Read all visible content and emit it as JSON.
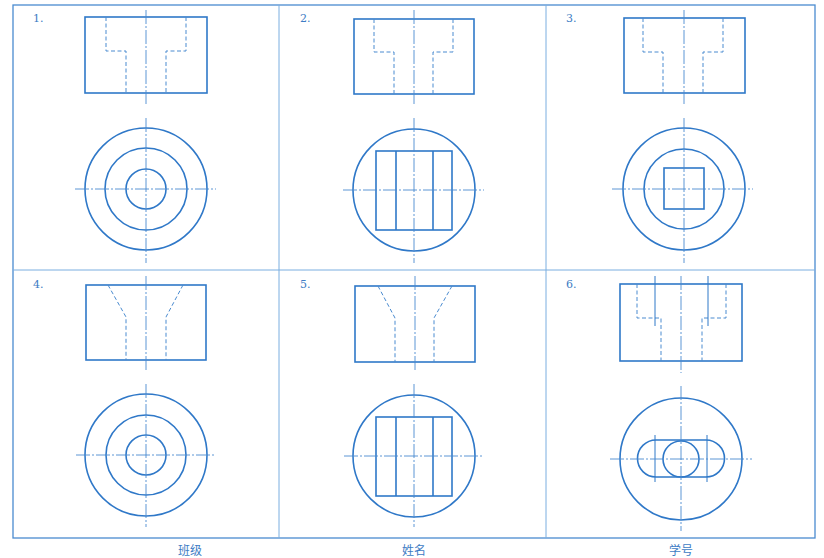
{
  "colors": {
    "line": "#2f78c8",
    "frame": "#4a8bd0",
    "text": "#3d7cc4",
    "background": "#ffffff"
  },
  "problems": [
    {
      "number": "1.",
      "front_view": "rectangle-with-stepped-hidden-bore",
      "top_view": "three-concentric-circles"
    },
    {
      "number": "2.",
      "front_view": "rectangle-with-stepped-hidden-bore",
      "top_view": "circle-with-square-and-two-vertical-lines"
    },
    {
      "number": "3.",
      "front_view": "rectangle-with-stepped-hidden-bore",
      "top_view": "two-concentric-circles-with-inner-square"
    },
    {
      "number": "4.",
      "front_view": "rectangle-with-hidden-funnel-bore",
      "top_view": "three-concentric-circles"
    },
    {
      "number": "5.",
      "front_view": "rectangle-with-hidden-funnel-bore",
      "top_view": "circle-with-square-and-two-vertical-lines"
    },
    {
      "number": "6.",
      "front_view": "rectangle-with-stepped-hidden-bore-and-slot-centerlines",
      "top_view": "circle-with-obround-slot-and-inner-circle"
    }
  ],
  "footer": {
    "class_label": "班级",
    "name_label": "姓名",
    "student_id_label": "学号"
  }
}
